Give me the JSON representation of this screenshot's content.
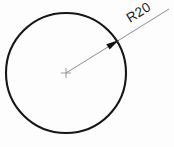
{
  "drawing": {
    "title": "Circle with radius dimension",
    "background_color": "#fdfdfd",
    "width": 174,
    "height": 147,
    "circle": {
      "name": "circle",
      "center_x": 66,
      "center_y": 73,
      "radius": 60,
      "stroke_color": "#161616",
      "stroke_width": 2.1,
      "fill": "none"
    },
    "center_mark": {
      "name": "center-mark",
      "x": 66,
      "y": 73,
      "size": 10,
      "stroke_color": "#9a9a9a",
      "stroke_width": 1
    },
    "leader_line": {
      "name": "radius-leader-line",
      "x1": 66,
      "y1": 73,
      "x2": 169,
      "y2": 9,
      "stroke_color": "#8d8d8d",
      "stroke_width": 1
    },
    "arrowhead": {
      "name": "radius-arrowhead",
      "tip_x": 119,
      "tip_y": 40,
      "angle_deg": -31.8,
      "length": 13,
      "half_width": 3.2,
      "fill_color": "#121212"
    },
    "dimension_label": {
      "name": "radius-dimension-label",
      "text": "R20",
      "x": 130,
      "y": 23,
      "rotation_deg": -31.8,
      "font_size": 13.5,
      "color": "#1a1a1a"
    }
  }
}
